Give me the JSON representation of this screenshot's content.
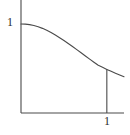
{
  "figure": {
    "name": "decreasing-concave-curve-plot",
    "background_color": "#ffffff",
    "line_color": "#4a4a4a",
    "label_color": "#2b2b2b",
    "axes": {
      "y_axis": {
        "name": "vertical-axis",
        "x_px": 21,
        "top_px": 0,
        "bottom_px": 113
      },
      "x_axis": {
        "name": "horizontal-axis",
        "y_px": 113,
        "left_px": 21,
        "right_px": 124
      }
    },
    "tick_labels": {
      "y_value": "1",
      "x_value": "1"
    },
    "dropline": {
      "name": "vertical-dropline-at-x-equals-1",
      "x_px": 107,
      "top_px": 68,
      "bottom_px": 113
    }
  },
  "chart_data": {
    "type": "line",
    "title": "",
    "xlabel": "",
    "ylabel": "",
    "xlim": [
      0,
      1.2
    ],
    "ylim": [
      0,
      1.15
    ],
    "grid": false,
    "legend": null,
    "xticks": [
      1
    ],
    "xtick_labels": [
      "1"
    ],
    "yticks": [
      1
    ],
    "ytick_labels": [
      "1"
    ],
    "annotations": [
      {
        "name": "dropline",
        "description": "vertical segment from curve down to x-axis at x = 1",
        "x": 1.0,
        "y_from": 0.0,
        "y_to": 0.49
      }
    ],
    "series": [
      {
        "name": "curve",
        "x": [
          0.0,
          0.05,
          0.1,
          0.15,
          0.2,
          0.25,
          0.3,
          0.35,
          0.4,
          0.45,
          0.5,
          0.55,
          0.6,
          0.65,
          0.7,
          0.75,
          0.8,
          0.85,
          0.9,
          0.95,
          1.0,
          1.05,
          1.1,
          1.15,
          1.2
        ],
        "y": [
          1.0,
          0.999,
          0.993,
          0.983,
          0.969,
          0.951,
          0.929,
          0.904,
          0.876,
          0.846,
          0.814,
          0.781,
          0.747,
          0.712,
          0.677,
          0.641,
          0.606,
          0.571,
          0.537,
          0.513,
          0.49,
          0.468,
          0.447,
          0.427,
          0.408
        ]
      }
    ]
  }
}
